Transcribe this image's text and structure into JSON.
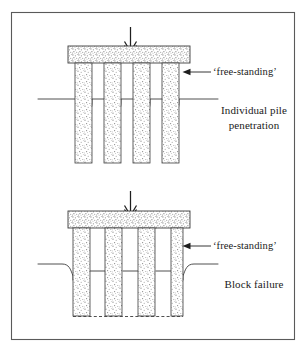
{
  "figure": {
    "background_color": "#ffffff",
    "frame_color": "#5a5a5a",
    "line_color": "#3c3c3c",
    "stipple_color": "#8c8c8c",
    "panels": [
      {
        "id": "individual-pile-penetration",
        "free_standing_label": "‘free-standing’",
        "mode_label": "Individual pile penetration",
        "load_arrow": "downward-load-arrow",
        "pile_count": 4,
        "cap_label": "pile-cap",
        "ground_line": "scalloped-between-piles"
      },
      {
        "id": "block-failure",
        "free_standing_label": "‘free-standing’",
        "mode_label": "Block failure",
        "load_arrow": "downward-load-arrow",
        "pile_count": 5,
        "cap_label": "pile-cap",
        "ground_line": "flat-with-outer-drawdown",
        "base_line": "dashed-block-failure-surface"
      }
    ]
  }
}
